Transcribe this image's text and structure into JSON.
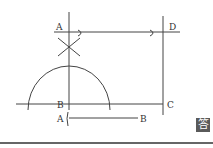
{
  "diagram": {
    "points": {
      "A_top": "A",
      "D": "D",
      "B": "B",
      "C": "C",
      "A_given": "A",
      "B_given": "B"
    },
    "answer_badge": "答"
  }
}
